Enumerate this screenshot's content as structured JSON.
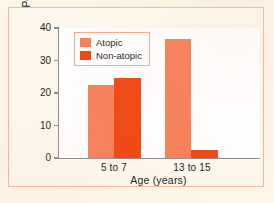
{
  "chart_data": {
    "type": "bar",
    "title": "",
    "subtitle": "",
    "xlabel": "Age (years)",
    "ylabel": "Percentage",
    "categories": [
      "5 to 7",
      "13 to 15"
    ],
    "series": [
      {
        "name": "Atopic",
        "color": "#f58058",
        "values": [
          22.5,
          36.5
        ]
      },
      {
        "name": "Non-atopic",
        "color": "#ee4712",
        "values": [
          24.5,
          2.5
        ]
      }
    ],
    "ylim": [
      0,
      40
    ],
    "yticks": [
      0,
      10,
      20,
      30,
      40
    ],
    "ytick_labels": [
      "0",
      "10",
      "20",
      "30",
      "40"
    ],
    "grid": false,
    "legend_position": "upper left",
    "annotations": []
  },
  "legend": {
    "entries": [
      {
        "label": "Atopic",
        "color": "#f58058"
      },
      {
        "label": "Non-atopic",
        "color": "#ee4712"
      }
    ]
  },
  "axes": {
    "y_title": "Percentage",
    "x_title": "Age (years)",
    "y_tick_0": "0",
    "y_tick_10": "10",
    "y_tick_20": "20",
    "y_tick_30": "30",
    "y_tick_40": "40",
    "x_cat_0": "5 to 7",
    "x_cat_1": "13 to 15"
  },
  "colors": {
    "page_background": "#fcf6e7",
    "frame_border": "#f3b9a3",
    "plot_background": "#ffffff",
    "axis_line": "#8d8d8d",
    "series_atopic": "#f58058",
    "series_non_atopic": "#ee4712",
    "text": "#1b1b1b"
  }
}
